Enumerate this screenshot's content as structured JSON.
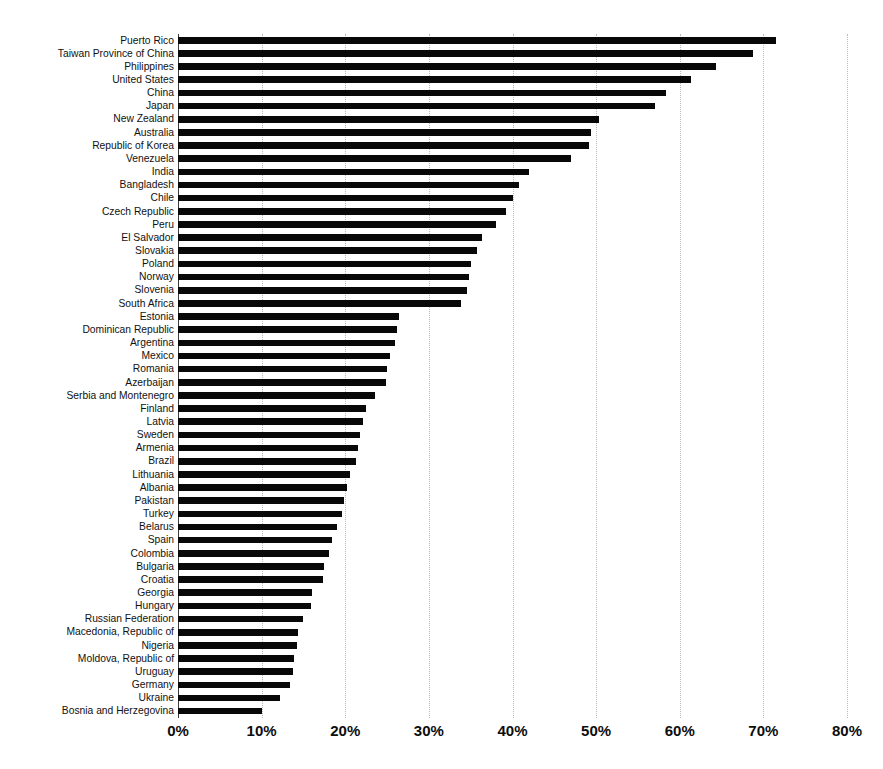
{
  "chart_data": {
    "type": "bar",
    "orientation": "horizontal",
    "title": "",
    "subtitle": "",
    "xlabel": "",
    "ylabel": "",
    "xlim": [
      0,
      80
    ],
    "xunit": "%",
    "grid": true,
    "legend": null,
    "xticks": [
      "0%",
      "10%",
      "20%",
      "30%",
      "40%",
      "50%",
      "60%",
      "70%",
      "80%"
    ],
    "xtick_values": [
      0,
      10,
      20,
      30,
      40,
      50,
      60,
      70,
      80
    ],
    "categories": [
      "Puerto Rico",
      "Taiwan Province of China",
      "Philippines",
      "United States",
      "China",
      "Japan",
      "New Zealand",
      "Australia",
      "Republic of Korea",
      "Venezuela",
      "India",
      "Bangladesh",
      "Chile",
      "Czech Republic",
      "Peru",
      "El Salvador",
      "Slovakia",
      "Poland",
      "Norway",
      "Slovenia",
      "South Africa",
      "Estonia",
      "Dominican Republic",
      "Argentina",
      "Mexico",
      "Romania",
      "Azerbaijan",
      "Serbia and Montenegro",
      "Finland",
      "Latvia",
      "Sweden",
      "Armenia",
      "Brazil",
      "Lithuania",
      "Albania",
      "Pakistan",
      "Turkey",
      "Belarus",
      "Spain",
      "Colombia",
      "Bulgaria",
      "Croatia",
      "Georgia",
      "Hungary",
      "Russian Federation",
      "Macedonia, Republic of",
      "Nigeria",
      "Moldova, Republic of",
      "Uruguay",
      "Germany",
      "Ukraine",
      "Bosnia and Herzegovina"
    ],
    "values": [
      71.5,
      68.7,
      64.3,
      61.3,
      58.3,
      57.0,
      50.3,
      49.4,
      49.1,
      47.0,
      42.0,
      40.8,
      40.0,
      39.2,
      38.0,
      36.4,
      35.8,
      35.0,
      34.8,
      34.6,
      33.9,
      26.4,
      26.2,
      25.9,
      25.4,
      25.0,
      24.9,
      23.6,
      22.5,
      22.1,
      21.8,
      21.5,
      21.3,
      20.6,
      20.2,
      19.8,
      19.6,
      19.0,
      18.4,
      18.0,
      17.5,
      17.3,
      16.0,
      15.9,
      14.9,
      14.4,
      14.2,
      13.9,
      13.7,
      13.4,
      12.2,
      10.0
    ]
  },
  "style": {
    "bar_color": "#080808",
    "grid_color": "#b9b9b9",
    "axis_color": "#3a3a3a",
    "background": "#ffffff",
    "text_color": "#111111"
  }
}
